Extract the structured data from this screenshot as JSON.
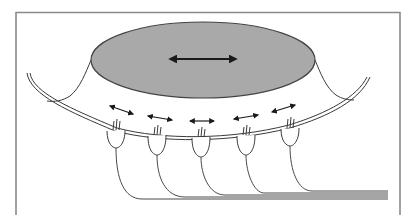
{
  "figure": {
    "type": "schematic",
    "colors": {
      "cupula_fill": "#a9a9a9",
      "line": "#3a3a3a",
      "arrow": "#1a1a1a",
      "frame": "#8a8a8a"
    },
    "elements": {
      "cupula": {
        "label": "",
        "motion": "bidirectional"
      },
      "hair_cells": [
        {
          "id": 1,
          "motion": "bidirectional"
        },
        {
          "id": 2,
          "motion": "bidirectional"
        },
        {
          "id": 3,
          "motion": "bidirectional"
        },
        {
          "id": 4,
          "motion": "bidirectional"
        },
        {
          "id": 5,
          "motion": "bidirectional"
        }
      ],
      "nerve_fiber_count": 5
    },
    "text_labels": []
  }
}
